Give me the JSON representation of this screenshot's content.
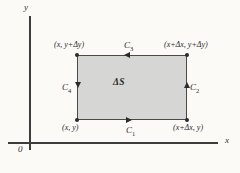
{
  "figure": {
    "type": "vector-calculus-diagram",
    "background_color": "#fbfaf7"
  },
  "axes": {
    "x_label": "x",
    "y_label": "y",
    "origin_label": "0",
    "axis_color": "#3c3c3c"
  },
  "region": {
    "label": "ΔS",
    "fill_color": "#d6d6d4",
    "border_color": "#4a4a4a"
  },
  "vertices": {
    "bottom_left": "(x, y)",
    "bottom_right": "(x+Δx, y)",
    "top_left": "(x, y+Δy)",
    "top_right": "(x+Δx, y+Δy)"
  },
  "curves": [
    {
      "id": "C1",
      "base": "C",
      "sub": "1",
      "edge": "bottom",
      "direction": "right"
    },
    {
      "id": "C2",
      "base": "C",
      "sub": "2",
      "edge": "right",
      "direction": "up"
    },
    {
      "id": "C3",
      "base": "C",
      "sub": "3",
      "edge": "top",
      "direction": "left"
    },
    {
      "id": "C4",
      "base": "C",
      "sub": "4",
      "edge": "left",
      "direction": "down"
    }
  ]
}
